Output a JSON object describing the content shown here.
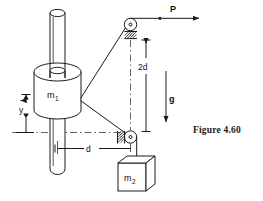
{
  "figure": {
    "caption": "Figure 4.60",
    "type": "mechanics-diagram",
    "labels": {
      "mass1": "m",
      "mass1_sub": "1",
      "mass2": "m",
      "mass2_sub": "2",
      "force_p": "P",
      "gravity": "g",
      "dim_vertical": "2d",
      "dim_horizontal": "d",
      "dim_y": "y"
    },
    "colors": {
      "line": "#1a1a1a",
      "reference_line": "#555555",
      "background": "#ffffff",
      "fill": "#ffffff"
    },
    "elements": [
      {
        "name": "vertical-rod",
        "description": "vertical guide rod with rounded ends"
      },
      {
        "name": "cylinder-mass-1",
        "description": "cylindrical collar labeled m1 sliding on rod"
      },
      {
        "name": "top-pulley",
        "description": "small pulley with hatched fixed support, upper right"
      },
      {
        "name": "bottom-pulley",
        "description": "small pulley with hatched fixed support, lower right"
      },
      {
        "name": "rope-upper",
        "description": "rope from cylinder to top pulley"
      },
      {
        "name": "rope-lower",
        "description": "rope from cylinder to bottom pulley"
      },
      {
        "name": "rope-horizontal",
        "description": "horizontal rope from top pulley, force P applied"
      },
      {
        "name": "rope-vertical",
        "description": "vertical rope from bottom pulley to block m2"
      },
      {
        "name": "block-mass-2",
        "description": "hanging cubic block labeled m2"
      },
      {
        "name": "gravity-arrow",
        "description": "downward arrow labeled g"
      },
      {
        "name": "dimension-2d",
        "description": "vertical dimension 2d between pulleys"
      },
      {
        "name": "dimension-d",
        "description": "horizontal dimension d from rod to bottom pulley"
      },
      {
        "name": "dimension-y",
        "description": "vertical dimension y from reference line up to cylinder"
      }
    ]
  }
}
